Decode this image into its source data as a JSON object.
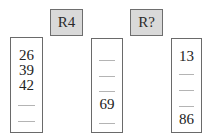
{
  "labels": {
    "left": "R4",
    "right": "R?"
  },
  "columns": [
    {
      "name": "column-1",
      "slots": [
        "26",
        "39",
        "42",
        "",
        ""
      ]
    },
    {
      "name": "column-2",
      "slots": [
        "",
        "",
        "",
        "69",
        ""
      ]
    },
    {
      "name": "column-3",
      "slots": [
        "13",
        "",
        "",
        "",
        "86"
      ]
    }
  ],
  "colors": {
    "label_fill": "#d9d9d9",
    "border": "#6a6a6a",
    "blank_line": "#b4b4b4"
  }
}
